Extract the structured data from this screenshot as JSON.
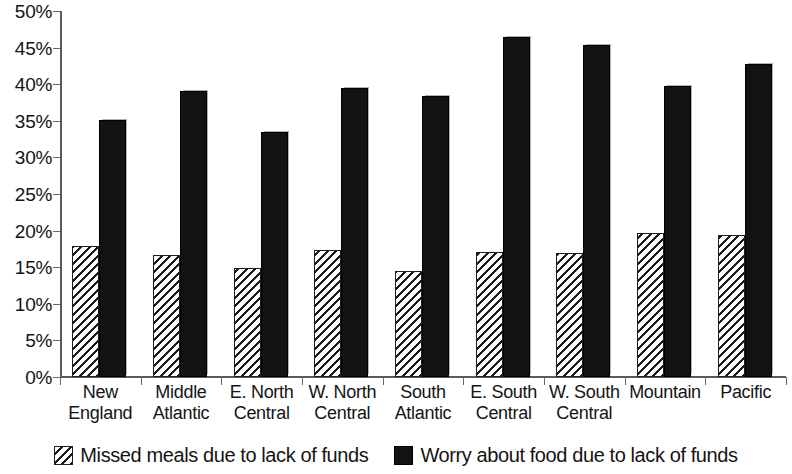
{
  "chart_data": {
    "type": "bar",
    "title": "",
    "subtitle": "",
    "xlabel": "",
    "ylabel": "",
    "ylim": [
      0,
      50
    ],
    "y_tick_labels": [
      "0%",
      "5%",
      "10%",
      "15%",
      "20%",
      "25%",
      "30%",
      "35%",
      "40%",
      "45%",
      "50%"
    ],
    "y_tick_values": [
      0,
      5,
      10,
      15,
      20,
      25,
      30,
      35,
      40,
      45,
      50
    ],
    "grid": false,
    "legend_position": "bottom",
    "categories": [
      "New England",
      "Middle Atlantic",
      "E. North Central",
      "W. North Central",
      "South Atlantic",
      "E. South Central",
      "W. South Central",
      "Mountain",
      "Pacific"
    ],
    "series": [
      {
        "name": "Missed meals due to lack of funds",
        "pattern": "diagonal-hatch",
        "color": "#ffffff",
        "values": [
          17.9,
          16.6,
          14.9,
          17.4,
          14.5,
          17.1,
          16.9,
          19.7,
          19.4
        ]
      },
      {
        "name": "Worry about food due to lack of funds",
        "pattern": "solid",
        "color": "#121212",
        "values": [
          35.1,
          39.1,
          33.5,
          39.5,
          38.4,
          46.5,
          45.4,
          39.8,
          42.8
        ]
      }
    ]
  },
  "legend": {
    "items": [
      {
        "label": "Missed meals due to lack of funds",
        "swatch": "hatch-swatch-icon"
      },
      {
        "label": "Worry about food due to lack of funds",
        "swatch": "solid-swatch-icon"
      }
    ]
  }
}
